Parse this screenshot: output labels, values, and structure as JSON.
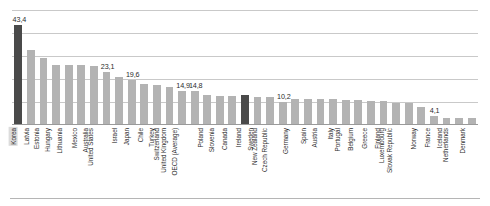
{
  "chart_data": {
    "type": "bar",
    "title": "",
    "subtitle": "",
    "xlabel": "",
    "ylabel": "",
    "ylim": [
      0,
      50
    ],
    "grid": true,
    "gridline_values": [
      50,
      40,
      30,
      20,
      10
    ],
    "legend": [],
    "legend_position": "none",
    "highlight_color": "#4a4a4a",
    "bar_color": "#b3b3b3",
    "highlighted_categories": [
      "Korea",
      "Ireland"
    ],
    "categories": [
      "Korea",
      "Latvia",
      "Estonia",
      "Hungary",
      "Lithuania",
      "Mexico",
      "Australia",
      "United States",
      "Israel",
      "Japan",
      "Chile",
      "Turkey",
      "Switzerland",
      "United Kingdom",
      "OECD (Average)",
      "Poland",
      "Slovenia",
      "Canada",
      "Ireland",
      "Sweden",
      "New Zealand",
      "Czech Republic",
      "Germany",
      "Spain",
      "Austria",
      "Italy",
      "Portugal",
      "Belgium",
      "Greece",
      "Finland",
      "Luxembourg",
      "Slovak Republic",
      "Norway",
      "France",
      "Iceland",
      "Netherlands",
      "Denmark"
    ],
    "values": [
      43.4,
      32.5,
      29.0,
      26.0,
      26.0,
      26.0,
      25.8,
      23.1,
      21.0,
      19.6,
      18.0,
      17.5,
      16.5,
      14.9,
      14.8,
      13.0,
      12.6,
      12.5,
      13.2,
      12.2,
      12.0,
      10.2,
      11.5,
      11.3,
      11.2,
      11.1,
      11.0,
      10.9,
      10.6,
      10.5,
      9.5,
      9.4,
      8.0,
      4.1,
      3.0,
      3.0,
      3.0
    ],
    "data_labels": [
      {
        "category": "Korea",
        "text": "43,4"
      },
      {
        "category": "United States",
        "text": "23,1"
      },
      {
        "category": "Japan",
        "text": "19,6"
      },
      {
        "category": "United Kingdom",
        "text": "14,9"
      },
      {
        "category": "OECD (Average)",
        "text": "14,8"
      },
      {
        "category": "Czech Republic",
        "text": "10,2"
      },
      {
        "category": "France",
        "text": "4,1"
      }
    ]
  }
}
